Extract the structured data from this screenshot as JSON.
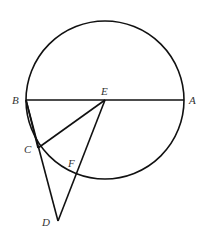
{
  "diagram": {
    "type": "geometry",
    "circle": {
      "center": "E",
      "cx": 105,
      "cy": 100,
      "r": 79
    },
    "points": {
      "A": {
        "label": "A",
        "x": 184,
        "y": 100
      },
      "B": {
        "label": "B",
        "x": 26,
        "y": 100
      },
      "E": {
        "label": "E",
        "x": 105,
        "y": 100
      },
      "C": {
        "label": "C",
        "x": 38,
        "y": 148
      },
      "D": {
        "label": "D",
        "x": 58,
        "y": 221
      },
      "F": {
        "label": "F",
        "x": 76,
        "y": 178
      }
    },
    "segments": [
      "AB",
      "BC",
      "CE",
      "ED",
      "CD",
      "BD"
    ],
    "labels": {
      "A": "A",
      "B": "B",
      "C": "C",
      "D": "D",
      "E": "E",
      "F": "F"
    }
  },
  "colors": {
    "stroke": "#111111",
    "label": "#333333"
  }
}
